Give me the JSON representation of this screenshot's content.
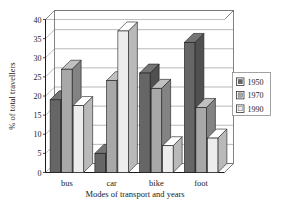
{
  "chart_data": {
    "type": "bar",
    "title": "",
    "subtitle": "",
    "xlabel": "Modes of transport and years",
    "ylabel": "% of total travellers",
    "categories": [
      "bus",
      "car",
      "bike",
      "foot"
    ],
    "series": [
      {
        "name": "1950",
        "values": [
          19,
          5,
          26,
          34
        ],
        "color": "#666666"
      },
      {
        "name": "1970",
        "values": [
          27,
          24,
          22,
          17
        ],
        "color": "#a8a8a8"
      },
      {
        "name": "1990",
        "values": [
          17.5,
          37,
          7,
          9
        ],
        "color": "#ededed"
      }
    ],
    "ylim": [
      0,
      40
    ],
    "yticks": [
      0,
      5,
      10,
      15,
      20,
      25,
      30,
      35,
      40
    ],
    "ytick_labels": [
      "0",
      "5",
      "10",
      "15",
      "20",
      "25",
      "30",
      "35",
      "40"
    ],
    "grid": true,
    "grid_axis": "y",
    "legend_position": "right",
    "style": "3d-bar",
    "colors": {
      "axis": "#1a1a1a",
      "grid": "#8c8c8c",
      "frame": "#4d4d4d",
      "plot_background": "#ffffff",
      "page_background": "#ffffff",
      "bar_edge": "#1a1a1a",
      "legend_border": "#8c8c8c"
    }
  },
  "legend": {
    "entries": [
      {
        "label": "1950",
        "swatch": "#666666"
      },
      {
        "label": "1970",
        "swatch": "#a8a8a8"
      },
      {
        "label": "1990",
        "swatch": "#ededed"
      }
    ]
  }
}
